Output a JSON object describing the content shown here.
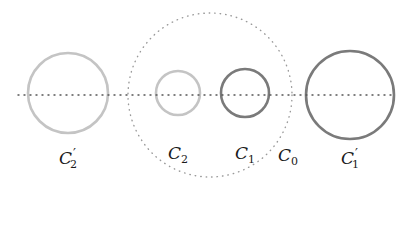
{
  "diagram": {
    "colors": {
      "background": "#ffffff",
      "light_circle": "#c4c4c4",
      "dark_circle": "#7a7a7a",
      "dotted": "#555555",
      "outer_dotted": "#9a9a9a",
      "label": "#1a1a1a"
    },
    "axis_line": {
      "x1": 18,
      "y1": 95,
      "x2": 392,
      "y2": 95,
      "style": "dotted"
    },
    "circles": [
      {
        "id": "C0",
        "cx": 210,
        "cy": 95,
        "r": 82,
        "style": "dotted",
        "tone": "outer"
      },
      {
        "id": "C2prime",
        "cx": 68,
        "cy": 93,
        "r": 40,
        "style": "solid",
        "tone": "light"
      },
      {
        "id": "C2",
        "cx": 178,
        "cy": 93,
        "r": 22,
        "style": "solid",
        "tone": "light"
      },
      {
        "id": "C1",
        "cx": 245,
        "cy": 93,
        "r": 24,
        "style": "solid",
        "tone": "dark"
      },
      {
        "id": "C1prime",
        "cx": 350,
        "cy": 95,
        "r": 44,
        "style": "solid",
        "tone": "dark"
      }
    ],
    "labels": {
      "c2prime": {
        "base": "C",
        "sub": "2",
        "prime": "′",
        "x": 68,
        "y": 158
      },
      "c2": {
        "base": "C",
        "sub": "2",
        "x": 178,
        "y": 155
      },
      "c1": {
        "base": "C",
        "sub": "1",
        "x": 245,
        "y": 155
      },
      "c0": {
        "base": "C",
        "sub": "0",
        "x": 288,
        "y": 157
      },
      "c1prime": {
        "base": "C",
        "sub": "1",
        "prime": "′",
        "x": 350,
        "y": 158
      }
    }
  }
}
